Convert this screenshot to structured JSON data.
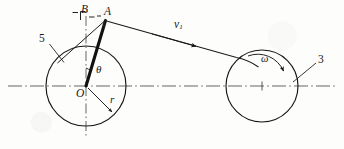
{
  "figure": {
    "background_color": "#fdfdfc",
    "ink_color": "#171717"
  },
  "labels": {
    "point_b": "B",
    "point_a": "A",
    "point_o": "O",
    "radius": "r",
    "angle_theta": "θ",
    "angular_velocity": "ω",
    "velocity": "v",
    "velocity_subscript": "1",
    "link_left": "5",
    "link_right": "3"
  },
  "geometry": {
    "left_pulley": {
      "cx": 86,
      "cy": 86,
      "r": 40
    },
    "right_pulley": {
      "cx": 262,
      "cy": 86,
      "r": 36
    },
    "point_a": {
      "x": 105,
      "y": 20
    },
    "point_b": {
      "x": 86,
      "y": 14
    },
    "centerline_y": 86,
    "crank_angle_deg": 16
  },
  "elements": {
    "centerline_style": "dash-dot",
    "vertical_axis_style": "dash-dot",
    "crank_style": "thick-solid",
    "belt_style": "thin-solid",
    "leader_style": "thin-solid"
  }
}
